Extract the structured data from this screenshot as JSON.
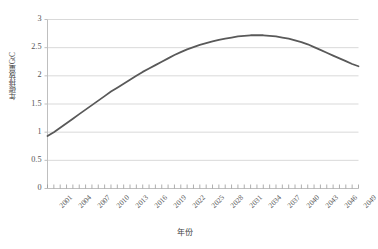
{
  "chart_data": {
    "type": "line",
    "title": "",
    "xlabel": "年份",
    "ylabel": "年碳排放量/GtC",
    "xlim": [
      2001,
      2050
    ],
    "ylim": [
      0,
      3
    ],
    "grid": true,
    "legend": false,
    "line_color": "#595959",
    "gridline_color": "#d9d9d9",
    "axis_color": "#bfbfbf",
    "background_color": "#ffffff",
    "ytick_labels": [
      "0",
      "0.5",
      "1",
      "1.5",
      "2",
      "2.5",
      "3"
    ],
    "ytick_values": [
      0,
      0.5,
      1,
      1.5,
      2,
      2.5,
      3
    ],
    "xtick_labels": [
      "2001",
      "2004",
      "2007",
      "2010",
      "2013",
      "2016",
      "2019",
      "2022",
      "2025",
      "2028",
      "2031",
      "2034",
      "2037",
      "2040",
      "2043",
      "2046",
      "2049"
    ],
    "xtick_values": [
      2001,
      2004,
      2007,
      2010,
      2013,
      2016,
      2019,
      2022,
      2025,
      2028,
      2031,
      2034,
      2037,
      2040,
      2043,
      2046,
      2049
    ],
    "series": [
      {
        "name": "年碳排放量",
        "x": [
          2001,
          2002,
          2003,
          2004,
          2005,
          2006,
          2007,
          2008,
          2009,
          2010,
          2011,
          2012,
          2013,
          2014,
          2015,
          2016,
          2017,
          2018,
          2019,
          2020,
          2021,
          2022,
          2023,
          2024,
          2025,
          2026,
          2027,
          2028,
          2029,
          2030,
          2031,
          2032,
          2033,
          2034,
          2035,
          2036,
          2037,
          2038,
          2039,
          2040,
          2041,
          2042,
          2043,
          2044,
          2045,
          2046,
          2047,
          2048,
          2049,
          2050
        ],
        "values": [
          0.93,
          1.0,
          1.08,
          1.16,
          1.24,
          1.32,
          1.4,
          1.48,
          1.56,
          1.64,
          1.72,
          1.79,
          1.86,
          1.93,
          2.0,
          2.07,
          2.13,
          2.19,
          2.25,
          2.31,
          2.37,
          2.42,
          2.47,
          2.51,
          2.55,
          2.58,
          2.61,
          2.64,
          2.66,
          2.68,
          2.7,
          2.71,
          2.72,
          2.72,
          2.72,
          2.71,
          2.7,
          2.68,
          2.66,
          2.63,
          2.6,
          2.56,
          2.51,
          2.46,
          2.41,
          2.36,
          2.31,
          2.26,
          2.21,
          2.17
        ]
      }
    ]
  }
}
